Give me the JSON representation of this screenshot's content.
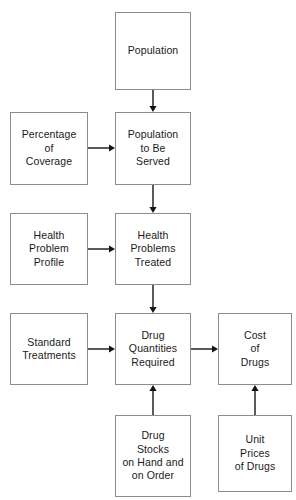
{
  "figure": {
    "caption_fragment": "",
    "background_color": "#ffffff",
    "box_border_color": "#8c8c8c",
    "arrow_color": "#141414",
    "text_color": "#1a1a1a"
  },
  "nodes": [
    {
      "id": "population",
      "label": "Population",
      "x": 115,
      "y": 12,
      "w": 76,
      "h": 78
    },
    {
      "id": "percentage",
      "label": "Percentage\nof\nCoverage",
      "x": 10,
      "y": 112,
      "w": 78,
      "h": 73
    },
    {
      "id": "population-served",
      "label": "Population\nto Be\nServed",
      "x": 115,
      "y": 112,
      "w": 76,
      "h": 73
    },
    {
      "id": "health-profile",
      "label": "Health\nProblem\nProfile",
      "x": 10,
      "y": 213,
      "w": 78,
      "h": 72
    },
    {
      "id": "health-treated",
      "label": "Health\nProblems\nTreated",
      "x": 115,
      "y": 213,
      "w": 76,
      "h": 72
    },
    {
      "id": "standard-treat",
      "label": "Standard\nTreatments",
      "x": 10,
      "y": 313,
      "w": 78,
      "h": 72
    },
    {
      "id": "drug-quantities",
      "label": "Drug\nQuantities\nRequired",
      "x": 115,
      "y": 313,
      "w": 76,
      "h": 72
    },
    {
      "id": "cost-of-drugs",
      "label": "Cost\nof\nDrugs",
      "x": 218,
      "y": 313,
      "w": 74,
      "h": 72
    },
    {
      "id": "drug-stocks",
      "label": "Drug\nStocks\non Hand and\non Order",
      "x": 115,
      "y": 415,
      "w": 76,
      "h": 82
    },
    {
      "id": "unit-prices",
      "label": "Unit\nPrices\nof Drugs",
      "x": 218,
      "y": 415,
      "w": 74,
      "h": 77
    }
  ],
  "connectors": [
    {
      "id": "population-to-served",
      "from": "population",
      "to": "population-served",
      "direction": "down",
      "x1": 153,
      "y1": 90,
      "x2": 153,
      "y2": 112
    },
    {
      "id": "percentage-to-served",
      "from": "percentage",
      "to": "population-served",
      "direction": "right",
      "x1": 88,
      "y1": 148,
      "x2": 115,
      "y2": 148
    },
    {
      "id": "served-to-treated",
      "from": "population-served",
      "to": "health-treated",
      "direction": "down",
      "x1": 153,
      "y1": 185,
      "x2": 153,
      "y2": 213
    },
    {
      "id": "profile-to-treated",
      "from": "health-profile",
      "to": "health-treated",
      "direction": "right",
      "x1": 88,
      "y1": 249,
      "x2": 115,
      "y2": 249
    },
    {
      "id": "treated-to-quantities",
      "from": "health-treated",
      "to": "drug-quantities",
      "direction": "down",
      "x1": 153,
      "y1": 285,
      "x2": 153,
      "y2": 313
    },
    {
      "id": "standard-to-quantities",
      "from": "standard-treat",
      "to": "drug-quantities",
      "direction": "right",
      "x1": 88,
      "y1": 349,
      "x2": 115,
      "y2": 349
    },
    {
      "id": "quantities-to-cost",
      "from": "drug-quantities",
      "to": "cost-of-drugs",
      "direction": "right",
      "x1": 191,
      "y1": 349,
      "x2": 218,
      "y2": 349
    },
    {
      "id": "stocks-to-quantities",
      "from": "drug-stocks",
      "to": "drug-quantities",
      "direction": "up",
      "x1": 153,
      "y1": 415,
      "x2": 153,
      "y2": 385
    },
    {
      "id": "prices-to-cost",
      "from": "unit-prices",
      "to": "cost-of-drugs",
      "direction": "up",
      "x1": 255,
      "y1": 415,
      "x2": 255,
      "y2": 385
    }
  ]
}
